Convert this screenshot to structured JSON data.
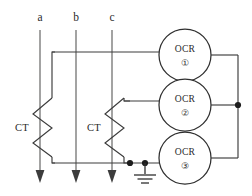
{
  "diagram": {
    "type": "electrical-schematic",
    "colors": {
      "line": "#3c3c3c",
      "text": "#2b2b2b",
      "background": "#ffffff",
      "junction": "#1d1d1d"
    },
    "phase_lines": [
      {
        "label": "a",
        "x": 40,
        "y_top": 30,
        "y_bottom": 182,
        "flow": "down"
      },
      {
        "label": "b",
        "x": 76,
        "y_top": 30,
        "y_bottom": 182,
        "flow": "down"
      },
      {
        "label": "c",
        "x": 112,
        "y_top": 30,
        "y_bottom": 182,
        "flow": "down"
      }
    ],
    "current_transformers": [
      {
        "label": "CT",
        "on_phase": "a",
        "x": 40,
        "y_center": 125
      },
      {
        "label": "CT",
        "on_phase": "c",
        "x": 112,
        "y_center": 125
      }
    ],
    "relays": [
      {
        "label": "OCR",
        "number": "①",
        "cx": 185,
        "cy": 55,
        "r": 26
      },
      {
        "label": "OCR",
        "number": "②",
        "cx": 185,
        "cy": 105,
        "r": 26
      },
      {
        "label": "OCR",
        "number": "③",
        "cx": 185,
        "cy": 158,
        "r": 26
      }
    ],
    "ground": {
      "symbol": "earth-ground",
      "x": 145,
      "y": 163
    },
    "junctions": [
      {
        "x": 130,
        "y": 163
      },
      {
        "x": 145,
        "y": 163
      },
      {
        "x": 238,
        "y": 105
      }
    ],
    "bus": {
      "label": "common-return-bus",
      "x": 238,
      "y_top": 55,
      "y_bottom": 158
    }
  }
}
